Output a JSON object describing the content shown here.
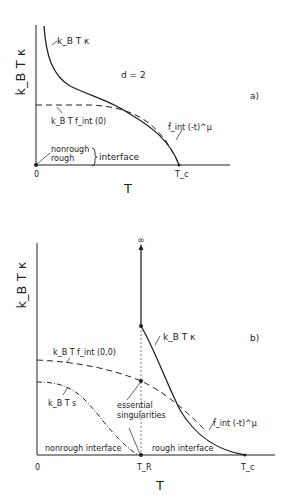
{
  "panel_a": {
    "tag": "a)",
    "y_axis_label": "k_B T κ",
    "x_axis_label": "T",
    "dimension_label": "d = 2",
    "curve_stiffness_label": "k_B T κ",
    "curve_free_energy_label": "k_B T f_int (0)",
    "critical_form_label": "f̂_int (-t)^μ",
    "brace_top": "nonrough",
    "brace_bottom": "rough",
    "brace_text": "interface",
    "tick_origin": "0",
    "tick_tc": "T_c"
  },
  "panel_b": {
    "tag": "b)",
    "y_axis_label": "k_B T κ",
    "x_axis_label": "T",
    "infinity_label": "∞",
    "curve_stiffness_label": "k_B T κ",
    "curve_free_energy_label": "k_B T f_int (0,0)",
    "curve_step_label": "k_B T s",
    "critical_form_label": "f̂_int (-t)^μ",
    "annotation_line1": "essential",
    "annotation_line2": "singularities",
    "region_left": "nonrough interface",
    "region_right": "rough interface",
    "tick_origin": "0",
    "tick_tr": "T_R",
    "tick_tc": "T_c"
  },
  "colors": {
    "ink": "#222222",
    "background": "#ffffff"
  }
}
